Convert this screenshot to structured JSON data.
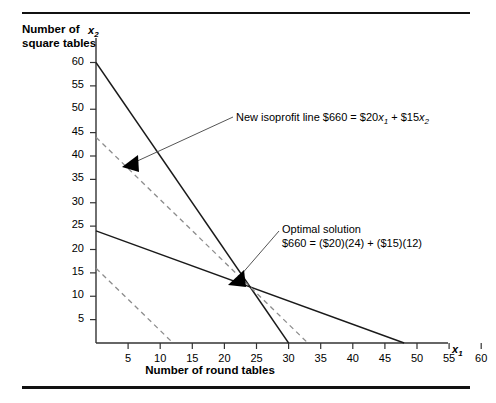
{
  "figure": {
    "y_axis_caption": "Number of square tables",
    "x_axis_caption": "Number of round tables",
    "x_axis_symbol": "x",
    "x_axis_symbol_sub": "1",
    "y_axis_symbol": "x",
    "y_axis_symbol_sub": "2"
  },
  "annotations": {
    "isoprofit": {
      "text_plain": "New isoprofit line $660 = $20x₁ + $15x₂",
      "prefix": "New isoprofit line $660  =  $20",
      "var1": "x",
      "var1_sub": "1",
      "middle": "  +  $15",
      "var2": "x",
      "var2_sub": "2"
    },
    "optimal": {
      "line1": "Optimal solution",
      "line2": "$660  =  ($20)(24)  +  ($15)(12)"
    }
  },
  "chart_data": {
    "type": "line",
    "title": "",
    "xlabel": "Number of round tables",
    "ylabel": "Number of square tables",
    "xlim": [
      0,
      65
    ],
    "ylim": [
      0,
      63
    ],
    "xticks": [
      5,
      10,
      15,
      20,
      25,
      30,
      35,
      40,
      45,
      50,
      55,
      60
    ],
    "yticks": [
      5,
      10,
      15,
      20,
      25,
      30,
      35,
      40,
      45,
      50,
      55,
      60
    ],
    "grid": false,
    "legend": "none",
    "optimal_solution": {
      "x": 24,
      "y": 12,
      "profit": 660
    },
    "series": [
      {
        "name": "constraint-1",
        "style": "solid",
        "color": "#1a1a1a",
        "points": [
          [
            0,
            60
          ],
          [
            30,
            0
          ]
        ]
      },
      {
        "name": "constraint-2",
        "style": "solid",
        "color": "#1a1a1a",
        "points": [
          [
            0,
            24
          ],
          [
            48,
            0
          ]
        ]
      },
      {
        "name": "isoprofit-660",
        "style": "dashed",
        "color": "#8c8c8c",
        "points": [
          [
            0,
            44
          ],
          [
            33,
            0
          ]
        ]
      },
      {
        "name": "isoprofit-lower",
        "style": "dashed",
        "color": "#8c8c8c",
        "points": [
          [
            0,
            16
          ],
          [
            12,
            0
          ]
        ]
      }
    ]
  }
}
